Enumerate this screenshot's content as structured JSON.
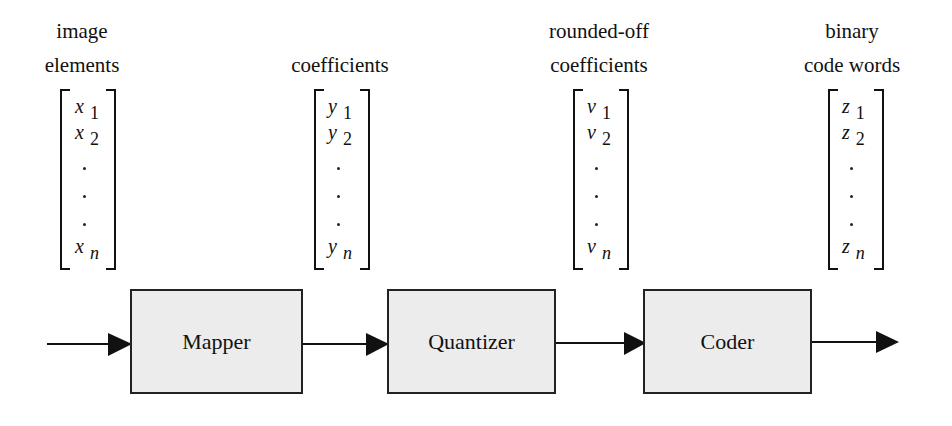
{
  "diagram": {
    "stages": [
      {
        "label_line1": "image",
        "label_line2": "elements",
        "var": "x",
        "subs": [
          "1",
          "2",
          "n"
        ]
      },
      {
        "label_line1": "",
        "label_line2": "coefficients",
        "var": "y",
        "subs": [
          "1",
          "2",
          "n"
        ]
      },
      {
        "label_line1": "rounded-off",
        "label_line2": "coefficients",
        "var": "v",
        "subs": [
          "1",
          "2",
          "n"
        ]
      },
      {
        "label_line1": "binary",
        "label_line2": "code words",
        "var": "z",
        "subs": [
          "1",
          "2",
          "n"
        ]
      }
    ],
    "blocks": [
      {
        "label": "Mapper"
      },
      {
        "label": "Quantizer"
      },
      {
        "label": "Coder"
      }
    ],
    "colors": {
      "block_fill": "#ececec",
      "line": "#111111"
    }
  }
}
